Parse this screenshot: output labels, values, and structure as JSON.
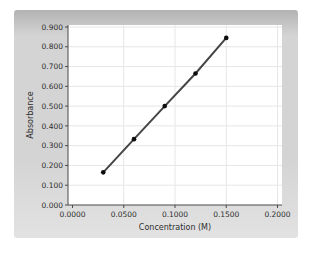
{
  "chart_data": {
    "type": "scatter",
    "xlabel": "Concentration (M)",
    "ylabel": "Absorbance",
    "x": [
      0.03,
      0.06,
      0.09,
      0.12,
      0.15
    ],
    "y": [
      0.165,
      0.333,
      0.5,
      0.665,
      0.845
    ],
    "xlim": [
      0.0,
      0.2
    ],
    "ylim": [
      0.0,
      0.9
    ],
    "x_ticks": [
      0.0,
      0.05,
      0.1,
      0.15,
      0.2
    ],
    "x_tick_labels": [
      "0.0000",
      "0.0500",
      "0.1000",
      "0.1500",
      "0.2000"
    ],
    "y_ticks": [
      0.0,
      0.1,
      0.2,
      0.3,
      0.4,
      0.5,
      0.6,
      0.7,
      0.8,
      0.9
    ],
    "y_tick_labels": [
      "0.000",
      "0.100",
      "0.200",
      "0.300",
      "0.400",
      "0.500",
      "0.600",
      "0.700",
      "0.800",
      "0.900"
    ],
    "grid": true,
    "legend": "none",
    "marker": "circle",
    "colors": {
      "panel_top": "#b3b3b3",
      "panel_mid": "#d4d4d4",
      "panel_bottom": "#e2e2e2",
      "plot_bg": "#ffffff",
      "grid": "#e6e6e6",
      "axis": "#4a4a4a",
      "line": "#454545",
      "marker": "#0d0d0d",
      "text": "#2e2e2e"
    }
  }
}
